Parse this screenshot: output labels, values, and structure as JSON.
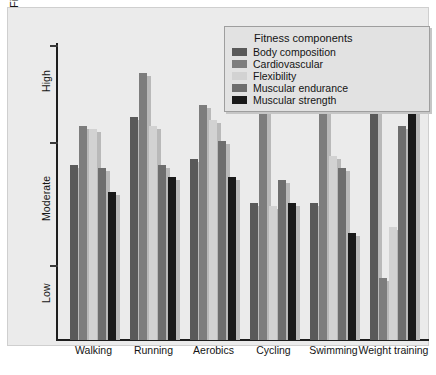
{
  "chart_data": {
    "type": "bar",
    "title": "",
    "xlabel": "",
    "ylabel": "Fitness benefit",
    "categories": [
      "Walking",
      "Running",
      "Aerobics",
      "Cycling",
      "Swimming",
      "Weight training"
    ],
    "ytick_labels": [
      "High",
      "Moderate",
      "Low"
    ],
    "ylim": [
      0,
      100
    ],
    "grid": false,
    "legend_position": "top-right",
    "legend_title": "Fitness components",
    "series": [
      {
        "name": "Body composition",
        "color": "#595959",
        "values": [
          59,
          75,
          61,
          46,
          46,
          83
        ]
      },
      {
        "name": "Cardiovascular",
        "color": "#7d7d7d",
        "values": [
          72,
          90,
          79,
          78,
          78,
          21
        ]
      },
      {
        "name": "Flexibility",
        "color": "#d2d2d2",
        "values": [
          71,
          72,
          74,
          45,
          62,
          38
        ]
      },
      {
        "name": "Muscular endurance",
        "color": "#6e6e6e",
        "values": [
          58,
          59,
          67,
          54,
          58,
          72
        ]
      },
      {
        "name": "Muscular strength",
        "color": "#1a1a1a",
        "values": [
          50,
          55,
          55,
          46,
          36,
          82
        ]
      }
    ]
  },
  "legend": {
    "title": "Fitness components",
    "entries": [
      {
        "label": "Body composition",
        "color": "#595959"
      },
      {
        "label": "Cardiovascular",
        "color": "#7d7d7d"
      },
      {
        "label": "Flexibility",
        "color": "#d2d2d2"
      },
      {
        "label": "Muscular endurance",
        "color": "#6e6e6e"
      },
      {
        "label": "Muscular strength",
        "color": "#1a1a1a"
      }
    ]
  },
  "axes": {
    "y_title": "Fitness benefit",
    "y_labels": {
      "high": "High",
      "moderate": "Moderate",
      "low": "Low"
    },
    "x_labels": [
      "Walking",
      "Running",
      "Aerobics",
      "Cycling",
      "Swimming",
      "Weight training"
    ]
  },
  "colors": {
    "panel_background": "#ebebeb",
    "axis": "#1d1d1d",
    "text": "#141414",
    "shadow": "#b9b9b9"
  }
}
